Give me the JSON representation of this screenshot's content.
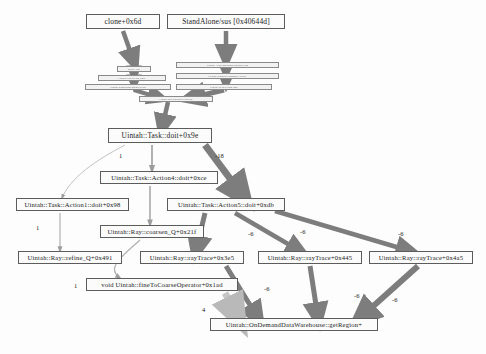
{
  "diagram": {
    "kind": "call-graph",
    "node_fill": "#fbfbfb",
    "node_stroke": "#5c5c5c",
    "edge_color_heavy": "#7d7d7d",
    "edge_color_light": "#b9b9b9",
    "background": "#fdfdfd"
  },
  "nodes": [
    {
      "id": "clone",
      "label": "clone+0x6d",
      "x": 86,
      "y": 14,
      "w": 74,
      "h": 17,
      "size": "big"
    },
    {
      "id": "standalone",
      "label": "StandAlone/sus [0x40644d]",
      "x": 167,
      "y": 14,
      "w": 118,
      "h": 17,
      "size": "big"
    },
    {
      "id": "m1",
      "label": "thread_start",
      "x": 117,
      "y": 66,
      "w": 34,
      "h": 6,
      "size": "micro"
    },
    {
      "id": "m2",
      "label": "Uintah::Thread::run_body",
      "x": 98,
      "y": 75,
      "w": 68,
      "h": 6,
      "size": "micro"
    },
    {
      "id": "m3",
      "label": "Uintah::SimulationController::run",
      "x": 85,
      "y": 84,
      "w": 86,
      "h": 6,
      "size": "micro"
    },
    {
      "id": "m4",
      "label": "Uintah::AMRSimulationController::run",
      "x": 176,
      "y": 62,
      "w": 103,
      "h": 6,
      "size": "micro"
    },
    {
      "id": "m5",
      "label": "Uintah::SchedulerCommon::execute",
      "x": 176,
      "y": 73,
      "w": 103,
      "h": 6,
      "size": "micro"
    },
    {
      "id": "m6",
      "label": "Uintah::DetailedTask::doit",
      "x": 176,
      "y": 84,
      "w": 96,
      "h": 6,
      "size": "micro"
    },
    {
      "id": "m7",
      "label": "Uintah::MPIScheduler::runTask",
      "x": 139,
      "y": 96,
      "w": 74,
      "h": 6,
      "size": "micro"
    },
    {
      "id": "doit",
      "label": "Uintah::Task::doit+0x9e",
      "x": 108,
      "y": 128,
      "w": 104,
      "h": 17,
      "size": "big"
    },
    {
      "id": "action4",
      "label": "Uintah::Task::Action4::doit+0xce",
      "x": 100,
      "y": 171,
      "w": 118,
      "h": 15,
      "size": "mid"
    },
    {
      "id": "action1",
      "label": "Uintah::Task::Action1::doit+0x98",
      "x": 16,
      "y": 198,
      "w": 113,
      "h": 15,
      "size": "mid"
    },
    {
      "id": "action5",
      "label": "Uintah::Task::Action5::doit+0xdb",
      "x": 167,
      "y": 198,
      "w": 118,
      "h": 15,
      "size": "mid"
    },
    {
      "id": "coarsen",
      "label": "Uintah::Ray::coarsen_Q+0x21f",
      "x": 100,
      "y": 225,
      "w": 104,
      "h": 15,
      "size": "mid"
    },
    {
      "id": "refine",
      "label": "Uintah::Ray::refine_Q+0x491",
      "x": 18,
      "y": 251,
      "w": 104,
      "h": 15,
      "size": "mid"
    },
    {
      "id": "ray3e5",
      "label": "Uintah::Ray::rayTrace+0x3e5",
      "x": 140,
      "y": 251,
      "w": 104,
      "h": 15,
      "size": "mid"
    },
    {
      "id": "ray445",
      "label": "Uintah::Ray::rayTrace+0x445",
      "x": 258,
      "y": 251,
      "w": 104,
      "h": 15,
      "size": "mid"
    },
    {
      "id": "ray4a5",
      "label": "Uintah::Ray::rayTrace+0x4a5",
      "x": 369,
      "y": 251,
      "w": 104,
      "h": 15,
      "size": "mid"
    },
    {
      "id": "fine2c",
      "label": "void Uintah::fineToCoarseOperator+0x1ad",
      "x": 86,
      "y": 278,
      "w": 152,
      "h": 15,
      "size": "mid"
    },
    {
      "id": "getregion",
      "label": "Uintah::OnDemandDataWarehouse::getRegion+",
      "x": 210,
      "y": 318,
      "w": 168,
      "h": 16,
      "size": "mid"
    }
  ],
  "edge_labels": [
    {
      "text": "1",
      "x": 119,
      "y": 152
    },
    {
      "text": "-18",
      "x": 215,
      "y": 152
    },
    {
      "text": "1",
      "x": 36,
      "y": 224
    },
    {
      "text": "-6",
      "x": 248,
      "y": 230
    },
    {
      "text": "-6",
      "x": 300,
      "y": 228
    },
    {
      "text": "-6",
      "x": 398,
      "y": 230
    },
    {
      "text": "1",
      "x": 74,
      "y": 282
    },
    {
      "text": "-6",
      "x": 264,
      "y": 285
    },
    {
      "text": "-6",
      "x": 354,
      "y": 292
    },
    {
      "text": "-6",
      "x": 392,
      "y": 296
    },
    {
      "text": "4",
      "x": 202,
      "y": 306
    }
  ]
}
